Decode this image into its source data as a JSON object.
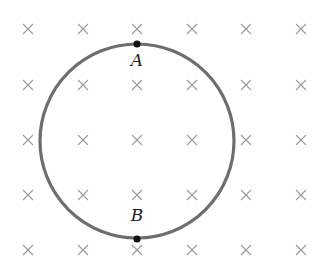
{
  "diagram": {
    "field": {
      "symbol": "cross",
      "meaning": "magnetic field into the page",
      "color": "#9a9a9a",
      "columns_x": [
        28,
        83,
        137,
        192,
        246,
        301
      ],
      "rows_y": [
        29,
        85,
        140,
        195,
        250
      ]
    },
    "loop": {
      "shape": "circle",
      "center": [
        137,
        141
      ],
      "radius": 97,
      "color": "#6e6e6e"
    },
    "points": [
      {
        "id": "A",
        "label": "A",
        "position": "top",
        "x": 137,
        "y": 44,
        "label_x": 137,
        "label_y": 66
      },
      {
        "id": "B",
        "label": "B",
        "position": "bottom",
        "x": 137,
        "y": 239,
        "label_x": 137,
        "label_y": 221
      }
    ]
  }
}
